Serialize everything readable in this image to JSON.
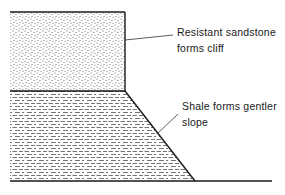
{
  "diagram": {
    "layers": [
      {
        "name": "sandstone",
        "pattern": "stipple",
        "label_line1": "Resistant sandstone",
        "label_line2": "forms cliff"
      },
      {
        "name": "shale",
        "pattern": "dashes",
        "label_line1": "Shale forms gentler",
        "label_line2": "slope"
      }
    ],
    "colors": {
      "line": "#1a1a1a",
      "fill_pattern": "#555555",
      "background": "#ffffff"
    }
  }
}
